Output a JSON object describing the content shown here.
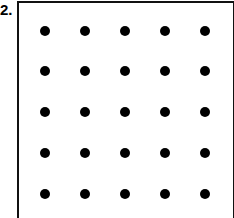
{
  "problem_label": "2.",
  "grid": {
    "rows": 5,
    "cols": 5,
    "col_x": [
      45,
      85,
      125,
      165,
      205
    ],
    "row_y": [
      31,
      71,
      112,
      153,
      194
    ],
    "dot_color": "#000000",
    "dot_diameter": 10
  }
}
